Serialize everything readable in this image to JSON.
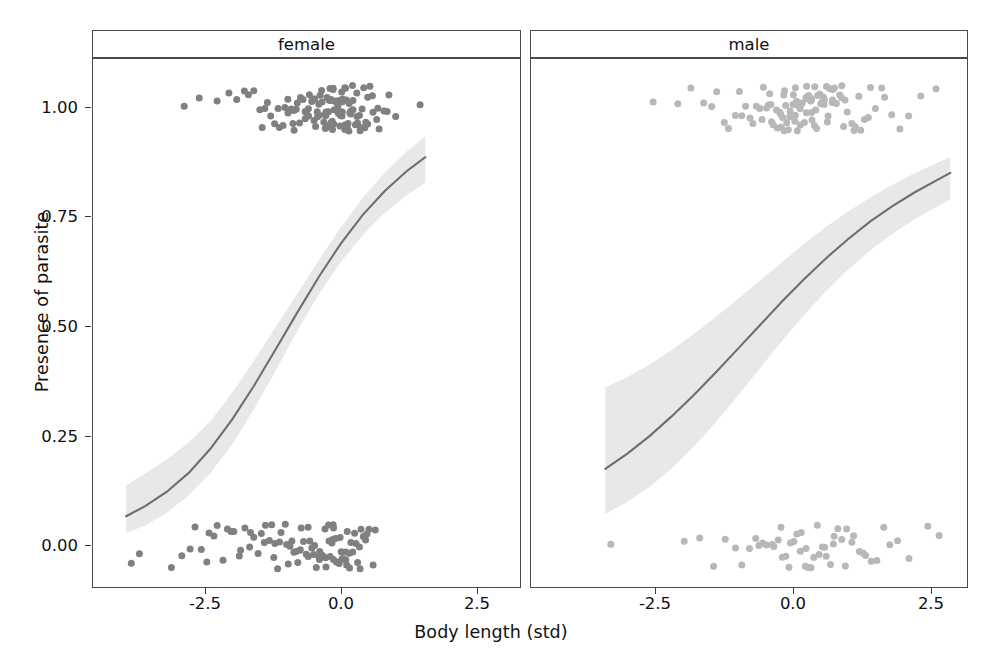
{
  "axes": {
    "x_label": "Body length (std)",
    "y_label": "Presence of parasite",
    "x_ticks": [
      "-2.5",
      "0.0",
      "2.5"
    ],
    "y_ticks": [
      "1.00",
      "0.75",
      "0.50",
      "0.25",
      "0.00"
    ]
  },
  "facets": [
    {
      "label": "female"
    },
    {
      "label": "male"
    }
  ],
  "colors": {
    "point_female": "#808080",
    "point_male": "#b8b8b8",
    "line": "#6e6e6e",
    "ribbon": "#e8e8e8",
    "panel_border": "#4a4a4a",
    "background": "#ffffff"
  },
  "chart_data": {
    "type": "scatter",
    "title": "",
    "subtitle": "",
    "xlabel": "Body length (std)",
    "ylabel": "Presence of parasite",
    "xlim": [
      -4.6,
      3.3
    ],
    "ylim": [
      -0.12,
      1.12
    ],
    "x_ticks": [
      -2.5,
      0.0,
      2.5
    ],
    "y_ticks": [
      0.0,
      0.25,
      0.5,
      0.75,
      1.0
    ],
    "grid": false,
    "legend": "none",
    "facet_by": "sex",
    "panels": [
      {
        "facet": "female",
        "point_color": "#808080",
        "fit": {
          "type": "logistic",
          "x": [
            -3.95,
            -3.6,
            -3.2,
            -2.8,
            -2.4,
            -2.0,
            -1.6,
            -1.2,
            -0.8,
            -0.4,
            0.0,
            0.4,
            0.8,
            1.2,
            1.55
          ],
          "y": [
            0.068,
            0.091,
            0.124,
            0.167,
            0.222,
            0.289,
            0.366,
            0.449,
            0.534,
            0.616,
            0.691,
            0.756,
            0.81,
            0.855,
            0.888
          ],
          "ci_lower": [
            0.03,
            0.047,
            0.076,
            0.116,
            0.167,
            0.232,
            0.312,
            0.401,
            0.492,
            0.576,
            0.649,
            0.71,
            0.76,
            0.8,
            0.83
          ],
          "ci_upper": [
            0.138,
            0.166,
            0.198,
            0.236,
            0.285,
            0.35,
            0.423,
            0.5,
            0.577,
            0.654,
            0.728,
            0.795,
            0.852,
            0.9,
            0.935
          ]
        },
        "points_y1_x": [
          -2.88,
          -2.62,
          -2.3,
          -2.08,
          -1.92,
          -1.78,
          -1.72,
          -1.6,
          -1.52,
          -1.46,
          -1.4,
          -1.33,
          -1.28,
          -1.22,
          -1.18,
          -1.12,
          -1.08,
          -1.04,
          -1.0,
          -0.97,
          -0.94,
          -0.9,
          -0.87,
          -0.84,
          -0.81,
          -0.78,
          -0.75,
          -0.73,
          -0.7,
          -0.68,
          -0.66,
          -0.63,
          -0.61,
          -0.59,
          -0.57,
          -0.55,
          -0.53,
          -0.51,
          -0.49,
          -0.47,
          -0.45,
          -0.44,
          -0.42,
          -0.4,
          -0.39,
          -0.37,
          -0.36,
          -0.34,
          -0.33,
          -0.31,
          -0.3,
          -0.29,
          -0.27,
          -0.26,
          -0.25,
          -0.24,
          -0.22,
          -0.21,
          -0.2,
          -0.19,
          -0.18,
          -0.17,
          -0.16,
          -0.15,
          -0.14,
          -0.13,
          -0.12,
          -0.11,
          -0.1,
          -0.09,
          -0.08,
          -0.07,
          -0.06,
          -0.05,
          -0.04,
          -0.03,
          -0.02,
          -0.01,
          0.0,
          0.01,
          0.02,
          0.03,
          0.04,
          0.05,
          0.06,
          0.07,
          0.08,
          0.09,
          0.1,
          0.12,
          0.13,
          0.14,
          0.16,
          0.17,
          0.18,
          0.2,
          0.21,
          0.23,
          0.24,
          0.26,
          0.28,
          0.29,
          0.31,
          0.33,
          0.35,
          0.37,
          0.39,
          0.41,
          0.43,
          0.46,
          0.48,
          0.51,
          0.54,
          0.57,
          0.6,
          0.64,
          0.68,
          0.72,
          0.77,
          0.83,
          0.9,
          1.0,
          1.45
        ],
        "points_y0_x": [
          -3.86,
          -3.7,
          -3.12,
          -2.92,
          -2.78,
          -2.7,
          -2.58,
          -2.48,
          -2.4,
          -2.33,
          -2.26,
          -2.18,
          -2.1,
          -2.02,
          -1.95,
          -1.88,
          -1.82,
          -1.76,
          -1.7,
          -1.64,
          -1.58,
          -1.53,
          -1.48,
          -1.43,
          -1.38,
          -1.33,
          -1.28,
          -1.24,
          -1.2,
          -1.16,
          -1.12,
          -1.08,
          -1.04,
          -1.0,
          -0.97,
          -0.93,
          -0.9,
          -0.86,
          -0.83,
          -0.8,
          -0.77,
          -0.74,
          -0.71,
          -0.68,
          -0.65,
          -0.62,
          -0.59,
          -0.56,
          -0.54,
          -0.51,
          -0.48,
          -0.46,
          -0.43,
          -0.41,
          -0.38,
          -0.36,
          -0.34,
          -0.31,
          -0.29,
          -0.27,
          -0.25,
          -0.23,
          -0.21,
          -0.19,
          -0.17,
          -0.15,
          -0.13,
          -0.11,
          -0.09,
          -0.07,
          -0.05,
          -0.03,
          -0.01,
          0.01,
          0.03,
          0.05,
          0.07,
          0.09,
          0.11,
          0.13,
          0.15,
          0.17,
          0.2,
          0.22,
          0.25,
          0.27,
          0.3,
          0.33,
          0.36,
          0.39,
          0.42,
          0.46,
          0.5,
          0.54,
          0.59,
          0.64
        ]
      },
      {
        "facet": "male",
        "point_color": "#b8b8b8",
        "fit": {
          "type": "logistic",
          "x": [
            -3.4,
            -3.0,
            -2.6,
            -2.2,
            -1.8,
            -1.4,
            -1.0,
            -0.6,
            -0.2,
            0.2,
            0.6,
            1.0,
            1.4,
            1.8,
            2.2,
            2.6,
            2.85
          ],
          "y": [
            0.176,
            0.211,
            0.251,
            0.296,
            0.344,
            0.396,
            0.45,
            0.504,
            0.558,
            0.609,
            0.657,
            0.701,
            0.741,
            0.776,
            0.807,
            0.835,
            0.852
          ],
          "ci_lower": [
            0.073,
            0.101,
            0.135,
            0.177,
            0.226,
            0.282,
            0.343,
            0.406,
            0.468,
            0.527,
            0.582,
            0.631,
            0.675,
            0.713,
            0.746,
            0.774,
            0.791
          ],
          "ci_upper": [
            0.362,
            0.386,
            0.414,
            0.447,
            0.484,
            0.523,
            0.564,
            0.606,
            0.648,
            0.69,
            0.729,
            0.764,
            0.796,
            0.825,
            0.851,
            0.874,
            0.888
          ]
        },
        "points_y1_x": [
          -2.55,
          -2.1,
          -1.86,
          -1.62,
          -1.5,
          -1.38,
          -1.26,
          -1.16,
          -1.06,
          -0.98,
          -0.9,
          -0.84,
          -0.78,
          -0.72,
          -0.67,
          -0.62,
          -0.58,
          -0.54,
          -0.5,
          -0.46,
          -0.43,
          -0.4,
          -0.37,
          -0.34,
          -0.31,
          -0.29,
          -0.26,
          -0.24,
          -0.22,
          -0.2,
          -0.18,
          -0.16,
          -0.14,
          -0.12,
          -0.1,
          -0.08,
          -0.06,
          -0.05,
          -0.03,
          -0.01,
          0.01,
          0.02,
          0.04,
          0.06,
          0.07,
          0.09,
          0.1,
          0.12,
          0.14,
          0.15,
          0.17,
          0.18,
          0.2,
          0.22,
          0.23,
          0.25,
          0.27,
          0.28,
          0.3,
          0.32,
          0.33,
          0.35,
          0.37,
          0.39,
          0.4,
          0.42,
          0.44,
          0.46,
          0.48,
          0.5,
          0.52,
          0.54,
          0.56,
          0.58,
          0.6,
          0.62,
          0.64,
          0.67,
          0.69,
          0.72,
          0.74,
          0.77,
          0.8,
          0.83,
          0.86,
          0.89,
          0.92,
          0.96,
          1.0,
          1.04,
          1.08,
          1.13,
          1.18,
          1.23,
          1.29,
          1.35,
          1.42,
          1.5,
          1.58,
          1.68,
          1.79,
          1.92,
          2.08,
          2.3,
          2.58
        ],
        "points_y0_x": [
          -3.32,
          -1.95,
          -1.7,
          -1.45,
          -1.22,
          -1.05,
          -0.92,
          -0.8,
          -0.7,
          -0.62,
          -0.54,
          -0.47,
          -0.4,
          -0.34,
          -0.28,
          -0.22,
          -0.17,
          -0.12,
          -0.07,
          -0.02,
          0.03,
          0.08,
          0.12,
          0.17,
          0.21,
          0.26,
          0.3,
          0.35,
          0.39,
          0.44,
          0.48,
          0.53,
          0.57,
          0.62,
          0.67,
          0.72,
          0.77,
          0.82,
          0.88,
          0.93,
          0.99,
          1.05,
          1.12,
          1.19,
          1.26,
          1.34,
          1.43,
          1.53,
          1.64,
          1.77,
          1.92,
          2.12,
          2.42,
          2.66
        ]
      }
    ]
  }
}
